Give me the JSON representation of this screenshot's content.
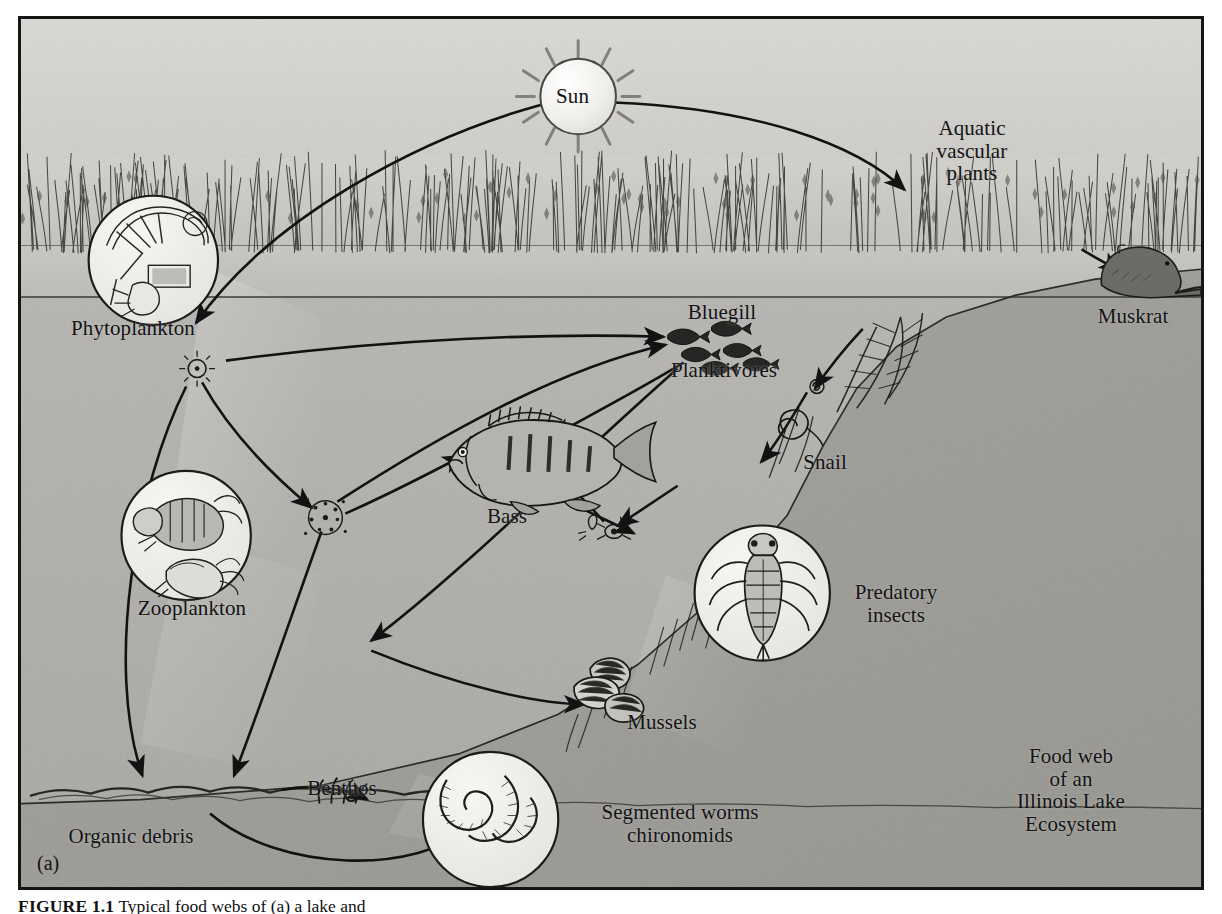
{
  "figure": {
    "panel_tag": "(a)",
    "title_block": [
      "Food web",
      "of an",
      "Illinois Lake",
      "Ecosystem"
    ],
    "caption_label": "FIGURE 1.1",
    "caption_text": "Typical food webs of (a) a lake and"
  },
  "nodes": {
    "sun": "Sun",
    "aquatic_plants": "Aquatic\nvascular\nplants",
    "muskrat": "Muskrat",
    "phytoplankton": "Phytoplankton",
    "zooplankton": "Zooplankton",
    "bluegill": "Bluegill",
    "planktivores": "Planktivores",
    "bass": "Bass",
    "snail": "Snail",
    "predatory_insects": "Predatory\ninsects",
    "mussels": "Mussels",
    "benthos": "Benthos",
    "organic_debris": "Organic debris",
    "segmented_worms": "Segmented worms\nchironomids"
  },
  "colors": {
    "frame": "#161616",
    "sky": "#d7d5d1",
    "water_upper": "#b9b7b3",
    "water_lower": "#a9a7a3",
    "lake_bottom": "#9b9996",
    "ink": "#141414",
    "inset_fill": "#eceae6",
    "sun_fill": "#f3f1ee"
  },
  "chart_data": {
    "type": "diagram",
    "node_list": [
      "Sun",
      "Aquatic vascular plants",
      "Muskrat",
      "Phytoplankton",
      "Zooplankton",
      "Bluegill",
      "Planktivores",
      "Bass",
      "Snail",
      "Predatory insects",
      "Mussels",
      "Benthos",
      "Organic debris",
      "Segmented worms chironomids"
    ],
    "edges": [
      {
        "from": "Sun",
        "to": "Phytoplankton"
      },
      {
        "from": "Sun",
        "to": "Aquatic vascular plants"
      },
      {
        "from": "Phytoplankton",
        "to": "Bluegill"
      },
      {
        "from": "Phytoplankton",
        "to": "Zooplankton"
      },
      {
        "from": "Phytoplankton",
        "to": "Organic debris"
      },
      {
        "from": "Zooplankton",
        "to": "Bluegill"
      },
      {
        "from": "Zooplankton",
        "to": "Organic debris"
      },
      {
        "from": "Bluegill",
        "to": "Bass"
      },
      {
        "from": "Bluegill",
        "to": "Organic debris"
      },
      {
        "from": "Predatory insects",
        "to": "Bass"
      },
      {
        "from": "Organic debris",
        "to": "Benthos"
      },
      {
        "from": "Organic debris",
        "to": "Mussels"
      },
      {
        "from": "Organic debris",
        "to": "Segmented worms chironomids"
      },
      {
        "from": "Aquatic vascular plants",
        "to": "Muskrat"
      },
      {
        "from": "Aquatic vascular plants",
        "to": "Snail"
      }
    ]
  }
}
